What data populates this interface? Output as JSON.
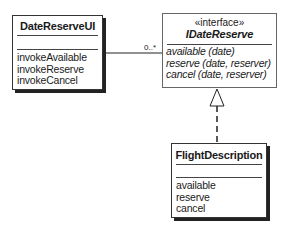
{
  "classes": {
    "ui": {
      "name": "DateReserveUI",
      "operations": [
        "invokeAvailable",
        "invokeReserve",
        "invokeCancel"
      ]
    },
    "interface": {
      "stereotype": "«interface»",
      "name": "IDateReserve",
      "operations": [
        "available (date)",
        "reserve (date, reserver)",
        "cancel (date, reserver)"
      ]
    },
    "impl": {
      "name": "FlightDescription",
      "operations": [
        "available",
        "reserve",
        "cancel"
      ]
    }
  },
  "relations": {
    "association": {
      "from": "DateReserveUI",
      "to": "IDateReserve",
      "multiplicity": "0..*"
    },
    "realization": {
      "from": "FlightDescription",
      "to": "IDateReserve"
    }
  }
}
